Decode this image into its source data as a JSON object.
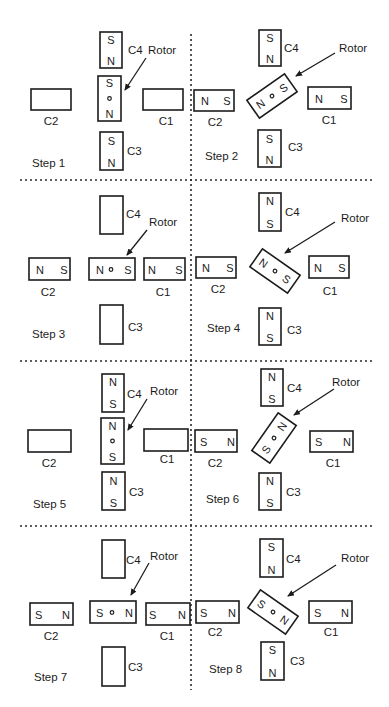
{
  "figure": {
    "rotor_label": "Rotor",
    "caption": "Figure 7.30 ... (partially cut off)"
  },
  "steps": [
    {
      "label": "Step 1",
      "coils": {
        "C4": {
          "label": "C4",
          "top": "S",
          "bottom": "N"
        },
        "C3": {
          "label": "C3",
          "top": "S",
          "bottom": "N"
        },
        "C2": {
          "label": "C2",
          "left": "",
          "right": ""
        },
        "C1": {
          "label": "C1",
          "left": "",
          "right": ""
        }
      },
      "rotor": {
        "end_a": "S",
        "end_b": "N",
        "angle_deg": 90
      }
    },
    {
      "label": "Step 2",
      "coils": {
        "C4": {
          "label": "C4",
          "top": "S",
          "bottom": "N"
        },
        "C3": {
          "label": "C3",
          "top": "S",
          "bottom": "N"
        },
        "C2": {
          "label": "C2",
          "left": "N",
          "right": "S"
        },
        "C1": {
          "label": "C1",
          "left": "N",
          "right": "S"
        }
      },
      "rotor": {
        "end_a": "N",
        "end_b": "S",
        "angle_deg": -35
      }
    },
    {
      "label": "Step 3",
      "coils": {
        "C4": {
          "label": "C4",
          "top": "",
          "bottom": ""
        },
        "C3": {
          "label": "C3",
          "top": "",
          "bottom": ""
        },
        "C2": {
          "label": "C2",
          "left": "N",
          "right": "S"
        },
        "C1": {
          "label": "C1",
          "left": "N",
          "right": "S"
        }
      },
      "rotor": {
        "end_a": "N",
        "end_b": "S",
        "angle_deg": 0
      }
    },
    {
      "label": "Step 4",
      "coils": {
        "C4": {
          "label": "C4",
          "top": "N",
          "bottom": "S"
        },
        "C3": {
          "label": "C3",
          "top": "N",
          "bottom": "S"
        },
        "C2": {
          "label": "C2",
          "left": "N",
          "right": "S"
        },
        "C1": {
          "label": "C1",
          "left": "N",
          "right": "S"
        }
      },
      "rotor": {
        "end_a": "N",
        "end_b": "S",
        "angle_deg": 35
      }
    },
    {
      "label": "Step 5",
      "coils": {
        "C4": {
          "label": "C4",
          "top": "N",
          "bottom": "S"
        },
        "C3": {
          "label": "C3",
          "top": "N",
          "bottom": "S"
        },
        "C2": {
          "label": "C2",
          "left": "",
          "right": ""
        },
        "C1": {
          "label": "C1",
          "left": "",
          "right": ""
        }
      },
      "rotor": {
        "end_a": "N",
        "end_b": "S",
        "angle_deg": 90
      }
    },
    {
      "label": "Step 6",
      "coils": {
        "C4": {
          "label": "C4",
          "top": "N",
          "bottom": "S"
        },
        "C3": {
          "label": "C3",
          "top": "N",
          "bottom": "S"
        },
        "C2": {
          "label": "C2",
          "left": "S",
          "right": "N"
        },
        "C1": {
          "label": "C1",
          "left": "S",
          "right": "N"
        }
      },
      "rotor": {
        "end_a": "S",
        "end_b": "N",
        "angle_deg": -35
      }
    },
    {
      "label": "Step 7",
      "coils": {
        "C4": {
          "label": "C4",
          "top": "",
          "bottom": ""
        },
        "C3": {
          "label": "C3",
          "top": "",
          "bottom": ""
        },
        "C2": {
          "label": "C2",
          "left": "S",
          "right": "N"
        },
        "C1": {
          "label": "C1",
          "left": "S",
          "right": "N"
        }
      },
      "rotor": {
        "end_a": "S",
        "end_b": "N",
        "angle_deg": 0
      }
    },
    {
      "label": "Step 8",
      "coils": {
        "C4": {
          "label": "C4",
          "top": "S",
          "bottom": "N"
        },
        "C3": {
          "label": "C3",
          "top": "S",
          "bottom": "N"
        },
        "C2": {
          "label": "C2",
          "left": "S",
          "right": "N"
        },
        "C1": {
          "label": "C1",
          "left": "S",
          "right": "N"
        }
      },
      "rotor": {
        "end_a": "S",
        "end_b": "N",
        "angle_deg": 35
      }
    }
  ]
}
